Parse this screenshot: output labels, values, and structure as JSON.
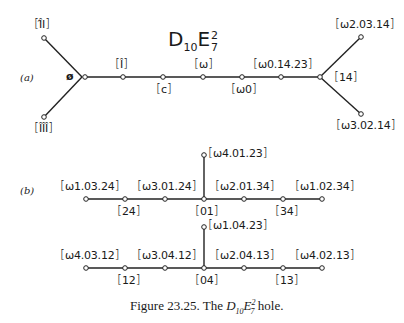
{
  "title": {
    "base1": "D",
    "sub1": "10",
    "base2": "E",
    "sup2": "2",
    "sub2": "7"
  },
  "part_a": {
    "label": "(a)",
    "junction_label": "ø",
    "left_upper": "Î̂I",
    "left_lower": "ÎÎÎ",
    "nodes": [
      "Î",
      "c",
      "ω",
      "ω0",
      "ω0.14.23"
    ],
    "right_junction": "14",
    "right_upper": "ω2.03.14",
    "right_lower": "ω3.02.14"
  },
  "part_b": {
    "label": "(b)",
    "row1": {
      "top_branch": "ω4.01.23",
      "above": [
        "ω1.03.24",
        "ω3.01.24",
        "ω2.01.34",
        "ω1.02.34"
      ],
      "below": [
        "24",
        "01",
        "34"
      ]
    },
    "row2": {
      "top_branch": "ω1.04.23",
      "above": [
        "ω4.03.12",
        "ω3.04.12",
        "ω2.04.13",
        "ω4.02.13"
      ],
      "below": [
        "12",
        "04",
        "13"
      ]
    }
  },
  "caption": {
    "prefix": "Figure 23.25. The ",
    "D": "D",
    "Dsub": "10",
    "E": "E",
    "Esup": "2",
    "Esub": "7",
    "suffix": " hole."
  }
}
